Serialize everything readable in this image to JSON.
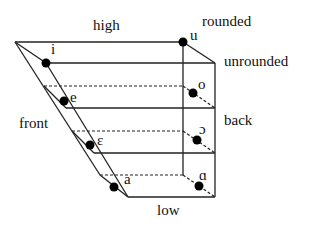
{
  "diagram": {
    "axis_labels": {
      "high": "high",
      "low": "low",
      "front": "front",
      "back": "back",
      "rounded": "rounded",
      "unrounded": "unrounded"
    },
    "vowels": {
      "front": [
        "i",
        "e",
        "ε",
        "a"
      ],
      "back": [
        "u",
        "o",
        "ɔ",
        "ɑ"
      ]
    },
    "colors": {
      "line": "#222222",
      "dot": "#000000",
      "background": "#ffffff"
    }
  }
}
